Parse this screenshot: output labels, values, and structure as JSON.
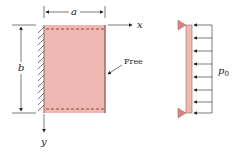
{
  "figure": {
    "labels": {
      "width_dim": "a",
      "height_dim": "b",
      "x_axis": "x",
      "y_axis": "y",
      "free_edge": "Free",
      "load": "p",
      "load_subscript": "0"
    },
    "colors": {
      "plate_fill": "#f0b8b2",
      "plate_edge": "#9a6a66",
      "dashed_line": "#8a3a32",
      "support": "#d9837a",
      "line": "#222222",
      "hatch": "#444444"
    }
  }
}
